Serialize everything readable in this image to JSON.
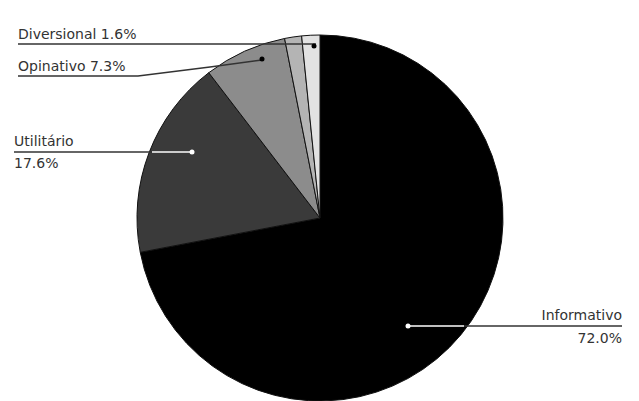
{
  "chart_data": {
    "type": "pie",
    "title": "",
    "start_angle_deg": 0,
    "direction": "clockwise",
    "slices": [
      {
        "label": "Informativo",
        "value": 72.0,
        "color": "#000000",
        "display": "Informativo",
        "display_pct": "72.0%"
      },
      {
        "label": "Utilitário",
        "value": 17.6,
        "color": "#3a3a3a",
        "display": "Utilitário",
        "display_pct": "17.6%"
      },
      {
        "label": "Opinativo",
        "value": 7.3,
        "color": "#8c8c8c",
        "display": "Opinativo 7.3%",
        "display_pct": ""
      },
      {
        "label": "",
        "value": 1.5,
        "color": "#b4b4b4",
        "display": "",
        "display_pct": ""
      },
      {
        "label": "Diversional",
        "value": 1.6,
        "color": "#e2e2e2",
        "display": "Diversional 1.6%",
        "display_pct": ""
      }
    ],
    "legend": "none"
  },
  "labels": {
    "diversional": "Diversional 1.6%",
    "opinativo": "Opinativo 7.3%",
    "utilitario_name": "Utilitário",
    "utilitario_pct": "17.6%",
    "informativo_name": "Informativo",
    "informativo_pct": "72.0%"
  }
}
